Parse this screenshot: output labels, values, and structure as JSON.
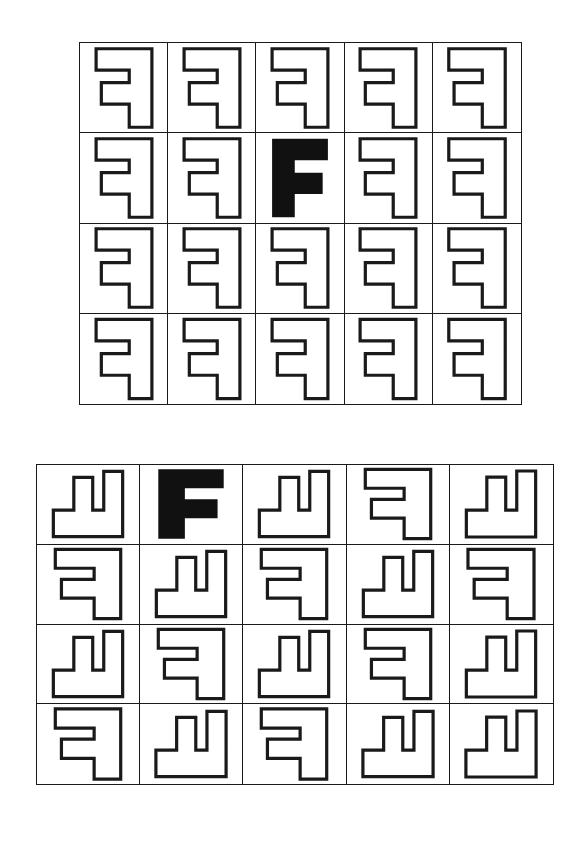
{
  "page": {
    "background": "#ffffff",
    "ink_color": "#1a1a1a",
    "fill_color": "#111111",
    "width": 587,
    "height": 866
  },
  "glyph": {
    "name": "block-letter-F",
    "description": "Outlined block capital letter F drawn as a closed polygon",
    "outline_points": "18,6 82,6 82,30 44,30 44,44 76,44 76,68 44,68 44,94 18,94",
    "viewbox": "0 0 100 100"
  },
  "panels": [
    {
      "id": "panel-top",
      "name": "top-stimulus-grid",
      "rows": 4,
      "cols": 5,
      "left": 79,
      "top": 42,
      "width": 443,
      "height": 363,
      "description": "All letters share one identical orientation: mirrored F, upright. One cell is solid black.",
      "cells": [
        {
          "row": 1,
          "col": 1,
          "rotation": 0,
          "mirrored": true,
          "filled": false
        },
        {
          "row": 1,
          "col": 2,
          "rotation": 0,
          "mirrored": true,
          "filled": false
        },
        {
          "row": 1,
          "col": 3,
          "rotation": 0,
          "mirrored": true,
          "filled": false
        },
        {
          "row": 1,
          "col": 4,
          "rotation": 0,
          "mirrored": true,
          "filled": false
        },
        {
          "row": 1,
          "col": 5,
          "rotation": 0,
          "mirrored": true,
          "filled": false
        },
        {
          "row": 2,
          "col": 1,
          "rotation": 0,
          "mirrored": true,
          "filled": false
        },
        {
          "row": 2,
          "col": 2,
          "rotation": 0,
          "mirrored": true,
          "filled": false
        },
        {
          "row": 2,
          "col": 3,
          "rotation": 0,
          "mirrored": false,
          "filled": true
        },
        {
          "row": 2,
          "col": 4,
          "rotation": 0,
          "mirrored": true,
          "filled": false
        },
        {
          "row": 2,
          "col": 5,
          "rotation": 0,
          "mirrored": true,
          "filled": false
        },
        {
          "row": 3,
          "col": 1,
          "rotation": 0,
          "mirrored": true,
          "filled": false
        },
        {
          "row": 3,
          "col": 2,
          "rotation": 0,
          "mirrored": true,
          "filled": false
        },
        {
          "row": 3,
          "col": 3,
          "rotation": 0,
          "mirrored": true,
          "filled": false
        },
        {
          "row": 3,
          "col": 4,
          "rotation": 0,
          "mirrored": true,
          "filled": false
        },
        {
          "row": 3,
          "col": 5,
          "rotation": 0,
          "mirrored": true,
          "filled": false
        },
        {
          "row": 4,
          "col": 1,
          "rotation": 0,
          "mirrored": true,
          "filled": false
        },
        {
          "row": 4,
          "col": 2,
          "rotation": 0,
          "mirrored": true,
          "filled": false
        },
        {
          "row": 4,
          "col": 3,
          "rotation": 0,
          "mirrored": true,
          "filled": false
        },
        {
          "row": 4,
          "col": 4,
          "rotation": 0,
          "mirrored": true,
          "filled": false
        },
        {
          "row": 4,
          "col": 5,
          "rotation": 0,
          "mirrored": true,
          "filled": false
        }
      ]
    },
    {
      "id": "panel-bottom",
      "name": "bottom-stimulus-grid",
      "rows": 4,
      "cols": 5,
      "left": 36,
      "top": 464,
      "width": 518,
      "height": 321,
      "description": "Letters appear in mixed rotations of 0 and 90 degrees, mirrored and unmirrored. One cell is solid black.",
      "cells": [
        {
          "row": 1,
          "col": 1,
          "rotation": 90,
          "mirrored": true,
          "filled": false
        },
        {
          "row": 1,
          "col": 2,
          "rotation": 0,
          "mirrored": false,
          "filled": true
        },
        {
          "row": 1,
          "col": 3,
          "rotation": 90,
          "mirrored": true,
          "filled": false
        },
        {
          "row": 1,
          "col": 4,
          "rotation": 0,
          "mirrored": true,
          "filled": false
        },
        {
          "row": 1,
          "col": 5,
          "rotation": 90,
          "mirrored": true,
          "filled": false
        },
        {
          "row": 1,
          "col": 6,
          "rotation": 0,
          "mirrored": true,
          "filled": false
        },
        {
          "row": 2,
          "col": 1,
          "rotation": 0,
          "mirrored": true,
          "filled": false
        },
        {
          "row": 2,
          "col": 2,
          "rotation": 90,
          "mirrored": true,
          "filled": false
        },
        {
          "row": 2,
          "col": 3,
          "rotation": 0,
          "mirrored": true,
          "filled": false
        },
        {
          "row": 2,
          "col": 4,
          "rotation": 90,
          "mirrored": true,
          "filled": false
        },
        {
          "row": 2,
          "col": 5,
          "rotation": 0,
          "mirrored": true,
          "filled": false
        },
        {
          "row": 3,
          "col": 1,
          "rotation": 90,
          "mirrored": true,
          "filled": false
        },
        {
          "row": 3,
          "col": 2,
          "rotation": 0,
          "mirrored": true,
          "filled": false
        },
        {
          "row": 3,
          "col": 3,
          "rotation": 90,
          "mirrored": true,
          "filled": false
        },
        {
          "row": 3,
          "col": 4,
          "rotation": 0,
          "mirrored": true,
          "filled": false
        },
        {
          "row": 3,
          "col": 5,
          "rotation": 90,
          "mirrored": true,
          "filled": false
        },
        {
          "row": 4,
          "col": 1,
          "rotation": 0,
          "mirrored": true,
          "filled": false
        },
        {
          "row": 4,
          "col": 2,
          "rotation": 90,
          "mirrored": true,
          "filled": false
        },
        {
          "row": 4,
          "col": 3,
          "rotation": 0,
          "mirrored": true,
          "filled": false
        },
        {
          "row": 4,
          "col": 4,
          "rotation": 90,
          "mirrored": true,
          "filled": false
        },
        {
          "row": 4,
          "col": 5,
          "rotation": 90,
          "mirrored": true,
          "filled": false
        }
      ]
    }
  ]
}
